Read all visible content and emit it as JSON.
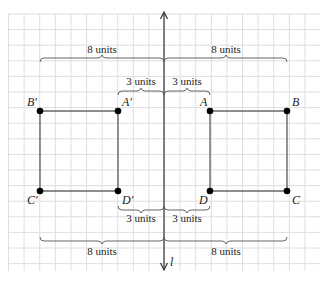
{
  "figure": {
    "line_label": "l",
    "grid": true,
    "original_points": [
      {
        "name": "A",
        "x": 3,
        "y": 5
      },
      {
        "name": "B",
        "x": 8,
        "y": 5
      },
      {
        "name": "C",
        "x": 8,
        "y": 0
      },
      {
        "name": "D",
        "x": 3,
        "y": 0
      }
    ],
    "image_points": [
      {
        "name": "A′",
        "x": -3,
        "y": 5
      },
      {
        "name": "B′",
        "x": -8,
        "y": 5
      },
      {
        "name": "C′",
        "x": -8,
        "y": 0
      },
      {
        "name": "D′",
        "x": -3,
        "y": 0
      }
    ],
    "measurements": {
      "top_left_large": "8 units",
      "top_right_large": "8 units",
      "top_left_small": "3 units",
      "top_right_small": "3 units",
      "bottom_left_small": "3 units",
      "bottom_right_small": "3 units",
      "bottom_left_large": "8 units",
      "bottom_right_large": "8 units"
    }
  }
}
